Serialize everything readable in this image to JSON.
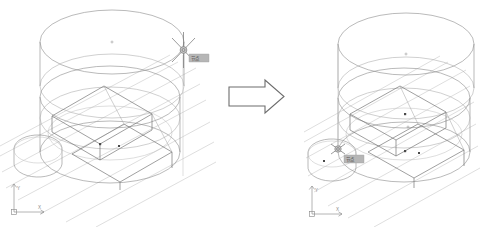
{
  "diagram": {
    "type": "before-after-cad-wireframe",
    "background_color": "#ffffff",
    "line_color": "#8c8c8c",
    "accent_line_color": "#777777",
    "node_color": "#4a4a4a"
  },
  "transition": {
    "arrow_name": "right-block-arrow",
    "direction": "right",
    "fill_color": "#ffffff",
    "stroke_color": "#6d6d6d"
  },
  "panels": [
    {
      "id": "before",
      "label": "before",
      "ucs": {
        "x_axis_label": "X",
        "y_axis_label": "Y",
        "origin_marker": "square"
      },
      "snap": {
        "marker_type": "node-osnap-marker",
        "marker_glyph": "x-in-circle",
        "tooltip_text": "节点",
        "tooltip_bg": "#b6b6b6",
        "tooltip_fg": "#3a3a3a"
      },
      "geometry": {
        "top_circle_center_marker": "+",
        "mid_circle_center_marker": "",
        "solids": [
          "large-cylinder",
          "top-cylinder-lid",
          "inner-box-wedge",
          "small-side-cylinder"
        ]
      }
    },
    {
      "id": "after",
      "label": "after",
      "ucs": {
        "x_axis_label": "X",
        "y_axis_label": "Y",
        "origin_marker": "square"
      },
      "snap": {
        "marker_type": "node-osnap-marker",
        "marker_glyph": "x-in-circle",
        "tooltip_text": "节点",
        "tooltip_bg": "#b6b6b6",
        "tooltip_fg": "#3a3a3a"
      },
      "geometry": {
        "top_circle_center_marker": "+",
        "mid_circle_center_marker": "+",
        "solids": [
          "large-cylinder",
          "top-cylinder-lid",
          "inner-box-wedge",
          "small-side-cylinder"
        ]
      }
    }
  ]
}
